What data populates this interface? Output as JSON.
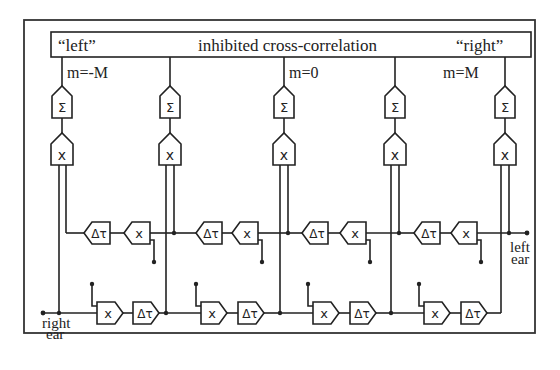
{
  "diagram": {
    "header": {
      "left_label": "“left”",
      "center_label": "inhibited cross-correlation",
      "right_label": "“right”"
    },
    "column_labels": [
      "m=-M",
      "",
      "m=0",
      "",
      "m=M"
    ],
    "columns": [
      {
        "index": 0,
        "sum_symbol": "Σ",
        "mult_symbol": "x"
      },
      {
        "index": 1,
        "sum_symbol": "Σ",
        "mult_symbol": "x"
      },
      {
        "index": 2,
        "sum_symbol": "Σ",
        "mult_symbol": "x"
      },
      {
        "index": 3,
        "sum_symbol": "Σ",
        "mult_symbol": "x"
      },
      {
        "index": 4,
        "sum_symbol": "Σ",
        "mult_symbol": "x"
      }
    ],
    "upper_delay_line": {
      "stage_count": 4,
      "delay_symbol": "Δτ",
      "mult_symbol": "x",
      "input_label_line1": "left",
      "input_label_line2": "ear"
    },
    "lower_delay_line": {
      "stage_count": 4,
      "delay_symbol": "Δτ",
      "mult_symbol": "x",
      "input_label_line1": "right",
      "input_label_line2": "ear"
    }
  }
}
